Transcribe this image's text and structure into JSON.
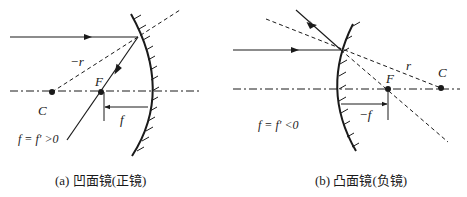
{
  "figure": {
    "panels": [
      {
        "id": "a",
        "caption": "(a) 凹面镜(正镜)",
        "labels": {
          "radius": "−r",
          "focus": "F",
          "center": "C",
          "focal_length": "f",
          "relation": "f = f′ >0"
        }
      },
      {
        "id": "b",
        "caption": "(b) 凸面镜(负镜)",
        "labels": {
          "radius": "r",
          "focus": "F",
          "center": "C",
          "focal_length": "−f",
          "relation": "f = f′ <0"
        }
      }
    ],
    "colors": {
      "ink": "#1a1a1a",
      "background": "#ffffff"
    }
  }
}
